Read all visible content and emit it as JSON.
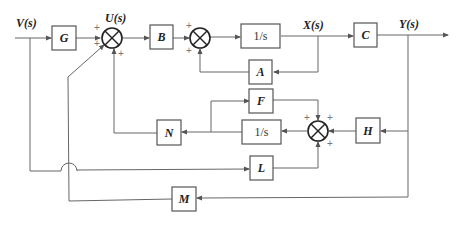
{
  "signals": {
    "input": "V(s)",
    "control": "U(s)",
    "state": "X(s)",
    "output": "Y(s)"
  },
  "blocks": {
    "G": "G",
    "B": "B",
    "integrator_top": "1/s",
    "C": "C",
    "A": "A",
    "F": "F",
    "N": "N",
    "integrator_bottom": "1/s",
    "H": "H",
    "L": "L",
    "M": "M"
  },
  "summing_junctions": {
    "sum1_signs": [
      "+",
      "+",
      "+"
    ],
    "sum2_signs": [
      "+",
      "+"
    ],
    "sum3_signs": [
      "+",
      "+",
      "+"
    ]
  },
  "colors": {
    "line": "#666666",
    "block_border": "#555555",
    "text": "#222222"
  }
}
